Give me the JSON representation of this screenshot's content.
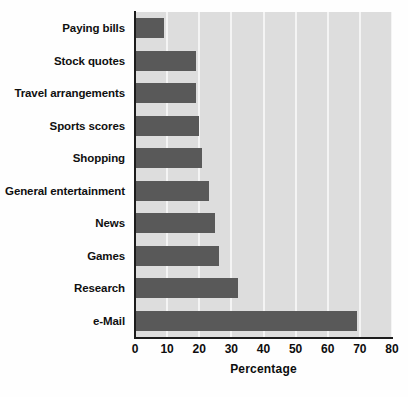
{
  "chart_data": {
    "type": "bar",
    "orientation": "horizontal",
    "title": "",
    "xlabel": "Percentage",
    "ylabel": "",
    "xlim": [
      0,
      80
    ],
    "xticks": [
      0,
      10,
      20,
      30,
      40,
      50,
      60,
      70,
      80
    ],
    "grid": "vertical",
    "legend": "none",
    "bar_color": "#595959",
    "plot_background": "#dddddd",
    "gridline_color": "#f4f4f4",
    "categories": [
      "Paying bills",
      "Stock quotes",
      "Travel arrangements",
      "Sports scores",
      "Shopping",
      "General entertainment",
      "News",
      "Games",
      "Research",
      "e-Mail"
    ],
    "values": [
      9,
      19,
      19,
      20,
      21,
      23,
      25,
      26,
      32,
      69
    ]
  }
}
